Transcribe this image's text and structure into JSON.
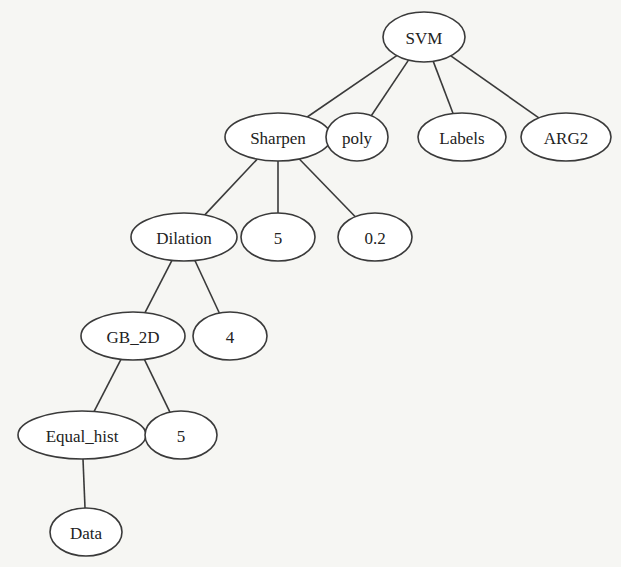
{
  "diagram": {
    "type": "tree",
    "nodes": [
      {
        "id": "svm",
        "label": "SVM",
        "cx": 424,
        "cy": 37,
        "rx": 41,
        "ry": 25
      },
      {
        "id": "sharpen",
        "label": "Sharpen",
        "cx": 278,
        "cy": 137,
        "rx": 53,
        "ry": 24
      },
      {
        "id": "poly",
        "label": "poly",
        "cx": 357,
        "cy": 137,
        "rx": 31,
        "ry": 24
      },
      {
        "id": "labels",
        "label": "Labels",
        "cx": 462,
        "cy": 137,
        "rx": 44,
        "ry": 24
      },
      {
        "id": "arg2",
        "label": "ARG2",
        "cx": 566,
        "cy": 137,
        "rx": 45,
        "ry": 24
      },
      {
        "id": "dilation",
        "label": "Dilation",
        "cx": 184,
        "cy": 237,
        "rx": 53,
        "ry": 24
      },
      {
        "id": "five_a",
        "label": "5",
        "cx": 278,
        "cy": 237,
        "rx": 37,
        "ry": 24
      },
      {
        "id": "zero_two",
        "label": "0.2",
        "cx": 375,
        "cy": 237,
        "rx": 37,
        "ry": 24
      },
      {
        "id": "gb2d",
        "label": "GB_2D",
        "cx": 133,
        "cy": 336,
        "rx": 52,
        "ry": 24
      },
      {
        "id": "four",
        "label": "4",
        "cx": 230,
        "cy": 336,
        "rx": 37,
        "ry": 24
      },
      {
        "id": "equal_hist",
        "label": "Equal_hist",
        "cx": 82,
        "cy": 435,
        "rx": 64,
        "ry": 24
      },
      {
        "id": "five_b",
        "label": "5",
        "cx": 181,
        "cy": 435,
        "rx": 36,
        "ry": 24
      },
      {
        "id": "data",
        "label": "Data",
        "cx": 86,
        "cy": 532,
        "rx": 36,
        "ry": 24
      }
    ],
    "edges": [
      {
        "from": "svm",
        "to": "sharpen"
      },
      {
        "from": "svm",
        "to": "poly"
      },
      {
        "from": "svm",
        "to": "labels"
      },
      {
        "from": "svm",
        "to": "arg2"
      },
      {
        "from": "sharpen",
        "to": "dilation"
      },
      {
        "from": "sharpen",
        "to": "five_a"
      },
      {
        "from": "sharpen",
        "to": "zero_two"
      },
      {
        "from": "dilation",
        "to": "gb2d"
      },
      {
        "from": "dilation",
        "to": "four"
      },
      {
        "from": "gb2d",
        "to": "equal_hist"
      },
      {
        "from": "gb2d",
        "to": "five_b"
      },
      {
        "from": "equal_hist",
        "to": "data"
      }
    ]
  }
}
